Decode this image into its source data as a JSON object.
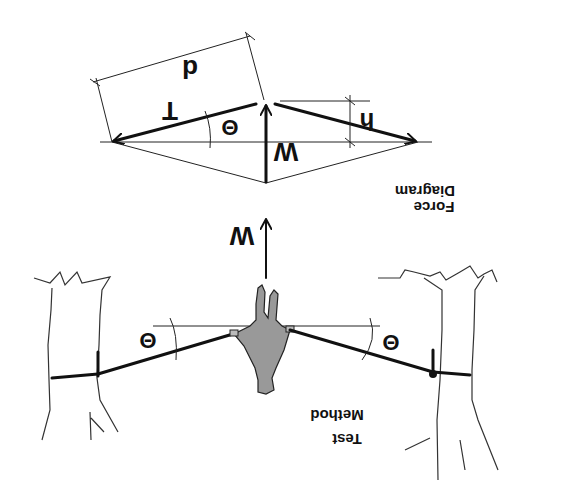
{
  "diagram": {
    "orientation": "rotated 180 degrees (upside down)",
    "force_diagram": {
      "title_line1": "Force",
      "title_line2": "Diagram",
      "labels": {
        "tension": "T",
        "weight": "W",
        "angle": "Θ",
        "height": "h",
        "length": "d"
      }
    },
    "test_method": {
      "title_line1": "Test",
      "title_line2": "Method",
      "labels": {
        "weight": "W",
        "angle_left": "Θ",
        "angle_right": "Θ"
      }
    }
  }
}
